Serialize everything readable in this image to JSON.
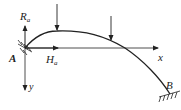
{
  "diagram": {
    "labels": {
      "reaction_vertical": "R",
      "reaction_vertical_sub": "a",
      "reaction_horizontal": "H",
      "reaction_horizontal_sub": "a",
      "support_a": "A",
      "support_b": "B",
      "axis_x": "x",
      "axis_y": "y"
    },
    "colors": {
      "stroke": "#222222",
      "background": "#ffffff"
    }
  }
}
